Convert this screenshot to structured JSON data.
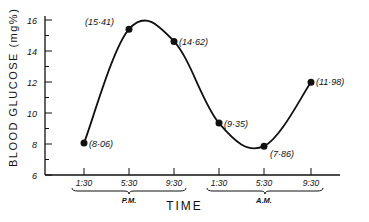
{
  "chart_data": {
    "type": "line",
    "title": "",
    "xlabel": "TIME",
    "ylabel": "BLOOD GLUCOSE (mg%)",
    "ylim": [
      6,
      16
    ],
    "yticks": [
      6,
      8,
      10,
      12,
      14,
      16
    ],
    "categories": [
      "1:30",
      "5:30",
      "9:30",
      "1:30",
      "5:30",
      "9:30"
    ],
    "groups": [
      {
        "label": "P.M.",
        "categories": [
          "1:30",
          "5:30",
          "9:30"
        ]
      },
      {
        "label": "A.M.",
        "categories": [
          "1:30",
          "5:30",
          "9:30"
        ]
      }
    ],
    "series": [
      {
        "name": "Blood glucose",
        "values": [
          8.06,
          15.41,
          14.62,
          9.35,
          7.86,
          11.98
        ]
      }
    ],
    "point_labels": [
      "(8·06)",
      "(15·41)",
      "(14·62)",
      "(9·35)",
      "(7·86)",
      "(11·98)"
    ],
    "grid": false,
    "smooth_curve": true
  },
  "axes": {
    "y_title": "BLOOD GLUCOSE (mg%)",
    "x_title": "TIME",
    "group_pm": "P.M.",
    "group_am": "A.M."
  }
}
